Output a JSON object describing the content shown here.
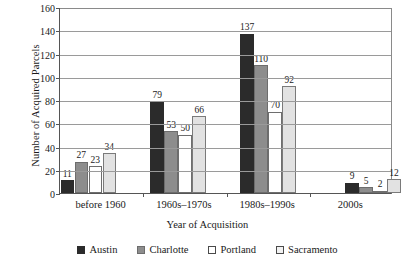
{
  "chart_data": {
    "type": "bar",
    "title": "",
    "xlabel": "Year of Acquisition",
    "ylabel": "Number of Acquired Parcels",
    "categories": [
      "before 1960",
      "1960s–1970s",
      "1980s–1990s",
      "2000s"
    ],
    "series": [
      {
        "name": "Austin",
        "color": "#2b2b2b",
        "values": [
          11,
          79,
          137,
          9
        ]
      },
      {
        "name": "Charlotte",
        "color": "#8d8d8d",
        "values": [
          27,
          53,
          110,
          5
        ]
      },
      {
        "name": "Portland",
        "color": "#ffffff",
        "values": [
          23,
          50,
          70,
          2
        ]
      },
      {
        "name": "Sacramento",
        "color": "#e2e2e2",
        "values": [
          34,
          66,
          92,
          12
        ]
      }
    ],
    "ylim": [
      0,
      160
    ],
    "yticks": [
      0,
      20,
      40,
      60,
      80,
      100,
      120,
      140,
      160
    ],
    "grid": true,
    "legend_position": "bottom"
  },
  "axis": {
    "y_title": "Number of Acquired Parcels",
    "x_title": "Year of Acquisition",
    "y_ticks": [
      "0",
      "20",
      "40",
      "60",
      "80",
      "100",
      "120",
      "140",
      "160"
    ]
  },
  "legend": {
    "items": [
      {
        "label": "Austin"
      },
      {
        "label": "Charlotte"
      },
      {
        "label": "Portland"
      },
      {
        "label": "Sacramento"
      }
    ]
  }
}
